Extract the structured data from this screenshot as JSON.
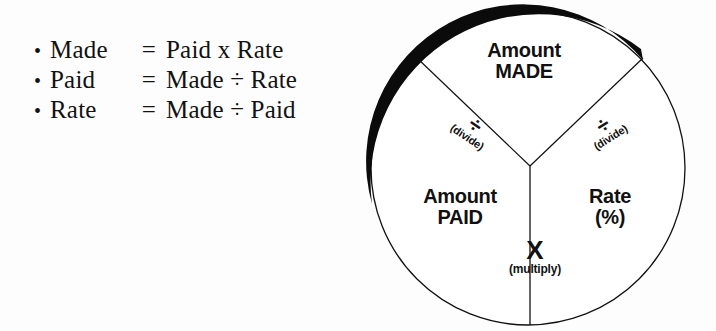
{
  "background_color": "#fdfdfd",
  "ink_color": "#111111",
  "formulas": {
    "rows": [
      {
        "bullet": "•",
        "lhs": "Made",
        "eq": "=",
        "rhs": "Paid x Rate"
      },
      {
        "bullet": "•",
        "lhs": "Paid",
        "eq": "=",
        "rhs": "Made ÷ Rate"
      },
      {
        "bullet": "•",
        "lhs": "Rate",
        "eq": "=",
        "rhs": "Made ÷ Paid"
      }
    ]
  },
  "diagram": {
    "type": "three-segment-circle",
    "segments": [
      {
        "id": "made",
        "line1": "Amount",
        "line2": "MADE"
      },
      {
        "id": "paid",
        "line1": "Amount",
        "line2": "PAID"
      },
      {
        "id": "rate",
        "line1": "Rate",
        "line2": "(%)"
      }
    ],
    "operators": [
      {
        "id": "divide-left",
        "symbol": "÷",
        "word": "(divide)"
      },
      {
        "id": "divide-right",
        "symbol": "÷",
        "word": "(divide)"
      },
      {
        "id": "multiply",
        "symbol": "X",
        "word": "(multiply)"
      }
    ]
  }
}
